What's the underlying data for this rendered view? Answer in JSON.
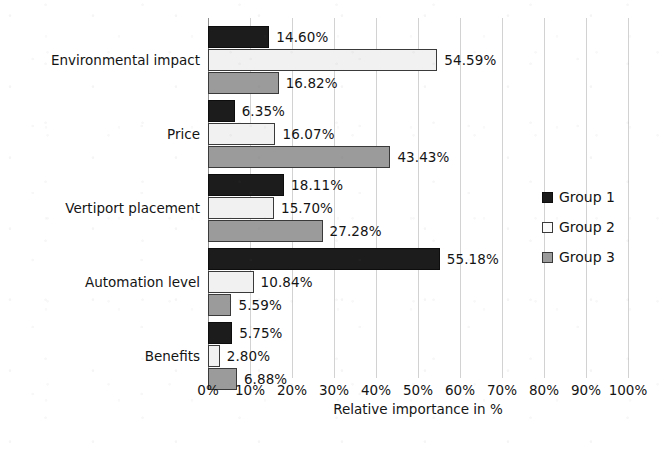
{
  "chart_data": {
    "type": "bar",
    "orientation": "horizontal",
    "title": "",
    "xlabel": "Relative importance in %",
    "ylabel": "",
    "xlim": [
      0,
      100
    ],
    "xticks": [
      "0%",
      "10%",
      "20%",
      "30%",
      "40%",
      "50%",
      "60%",
      "70%",
      "80%",
      "90%",
      "100%"
    ],
    "xtick_values": [
      0,
      10,
      20,
      30,
      40,
      50,
      60,
      70,
      80,
      90,
      100
    ],
    "grid": "vertical-only",
    "legend_position": "right",
    "categories": [
      "Environmental impact",
      "Price",
      "Vertiport placement",
      "Automation level",
      "Benefits"
    ],
    "series": [
      {
        "name": "Group 1",
        "color": "#1c1c1c",
        "values": [
          14.6,
          6.35,
          18.11,
          55.18,
          5.75
        ],
        "labels": [
          "14.60%",
          "6.35%",
          "18.11%",
          "55.18%",
          "5.75%"
        ]
      },
      {
        "name": "Group 2",
        "color": "#f1f1f1",
        "values": [
          54.59,
          16.07,
          15.7,
          10.84,
          2.8
        ],
        "labels": [
          "54.59%",
          "16.07%",
          "15.70%",
          "10.84%",
          "2.80%"
        ]
      },
      {
        "name": "Group 3",
        "color": "#9b9b9b",
        "values": [
          16.82,
          43.43,
          27.28,
          5.59,
          6.88
        ],
        "labels": [
          "16.82%",
          "43.43%",
          "27.28%",
          "5.59%",
          "6.88%"
        ]
      }
    ]
  },
  "legend": {
    "items": [
      {
        "label": "Group 1",
        "swatch": "black-square-icon"
      },
      {
        "label": "Group 2",
        "swatch": "white-square-icon"
      },
      {
        "label": "Group 3",
        "swatch": "gray-square-icon"
      }
    ]
  }
}
